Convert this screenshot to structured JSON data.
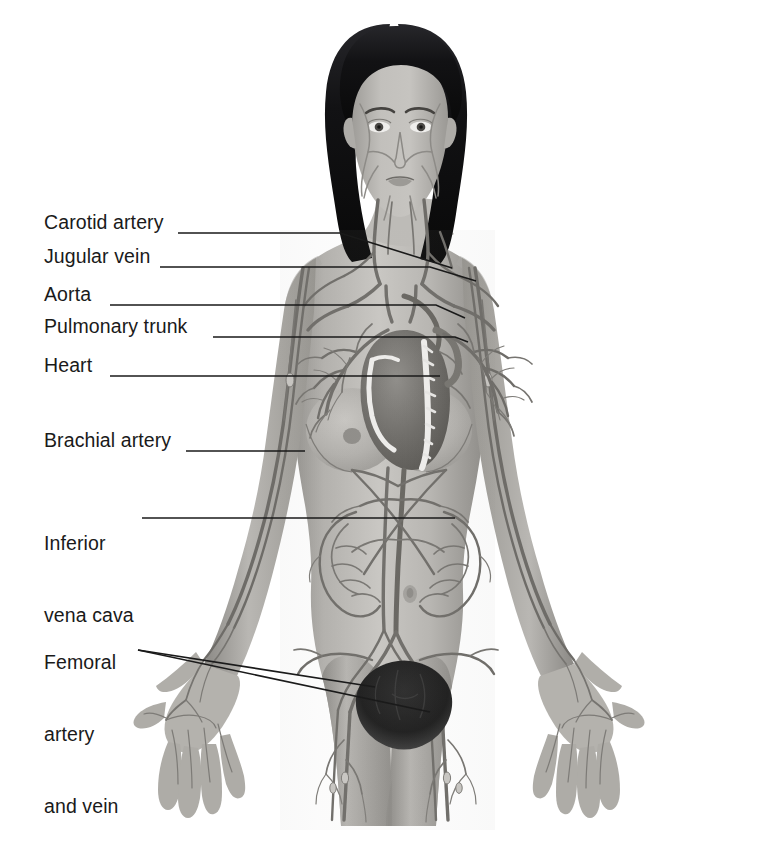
{
  "figure": {
    "style": "grayscale-medical-illustration",
    "background_color": "#ffffff",
    "ink_color": "#1a1a1a",
    "vessel_color": "#6f6f6f",
    "skin_color": "#b9b7b3",
    "hair_color": "#151515"
  },
  "labels": [
    {
      "id": "carotid-artery",
      "text": "Carotid artery",
      "lines": [
        "Carotid artery"
      ],
      "x": 44,
      "y": 221
    },
    {
      "id": "jugular-vein",
      "text": "Jugular vein",
      "lines": [
        "Jugular vein"
      ],
      "x": 44,
      "y": 255
    },
    {
      "id": "aorta",
      "text": "Aorta",
      "lines": [
        "Aorta"
      ],
      "x": 44,
      "y": 293
    },
    {
      "id": "pulmonary-trunk",
      "text": "Pulmonary trunk",
      "lines": [
        "Pulmonary trunk"
      ],
      "x": 44,
      "y": 325
    },
    {
      "id": "heart",
      "text": "Heart",
      "lines": [
        "Heart"
      ],
      "x": 44,
      "y": 364
    },
    {
      "id": "brachial-artery",
      "text": "Brachial artery",
      "lines": [
        "Brachial artery"
      ],
      "x": 44,
      "y": 439
    },
    {
      "id": "inferior-vena-cava",
      "text": "Inferior vena cava",
      "lines": [
        "Inferior",
        "vena cava"
      ],
      "x": 44,
      "y": 494
    },
    {
      "id": "femoral-artery-and-vein",
      "text": "Femoral artery and vein",
      "lines": [
        "Femoral",
        "artery",
        "and vein"
      ],
      "x": 44,
      "y": 613
    }
  ],
  "leaders": [
    {
      "id": "leader-carotid-artery",
      "points": "178,233 340,233 452,268"
    },
    {
      "id": "leader-jugular-vein",
      "points": "160,267 430,267 476,281"
    },
    {
      "id": "leader-aorta",
      "points": "110,305 436,305 465,318"
    },
    {
      "id": "leader-pulmonary-trunk",
      "points": "213,337 455,337 468,342"
    },
    {
      "id": "leader-heart",
      "points": "110,376 440,376"
    },
    {
      "id": "leader-brachial-artery",
      "points": "186,451 305,451"
    },
    {
      "id": "leader-inferior-vena-cava",
      "points": "142,518 455,518"
    },
    {
      "id": "leader-femoral-a",
      "points": "138,650 375,687"
    },
    {
      "id": "leader-femoral-b",
      "points": "138,650 430,712"
    }
  ],
  "anatomy_parts": [
    "head-and-hair",
    "face-vessels",
    "neck",
    "carotid-arteries",
    "jugular-veins",
    "shoulders",
    "thorax",
    "heart",
    "aortic-arch",
    "pulmonary-trunk",
    "pulmonary-vessel-tree-left",
    "pulmonary-vessel-tree-right",
    "breasts",
    "abdomen",
    "abdominal-aorta",
    "inferior-vena-cava",
    "mesenteric-vessel-loops",
    "navel",
    "pelvis",
    "pubic-hair",
    "femoral-artery-left",
    "femoral-vein-left",
    "femoral-artery-right",
    "femoral-vein-right",
    "upper-arm-left",
    "upper-arm-right",
    "brachial-artery-left",
    "brachial-artery-right",
    "forearm-left",
    "forearm-right",
    "hand-left",
    "hand-right",
    "palmar-arch-left",
    "palmar-arch-right",
    "thigh-left",
    "thigh-right"
  ]
}
